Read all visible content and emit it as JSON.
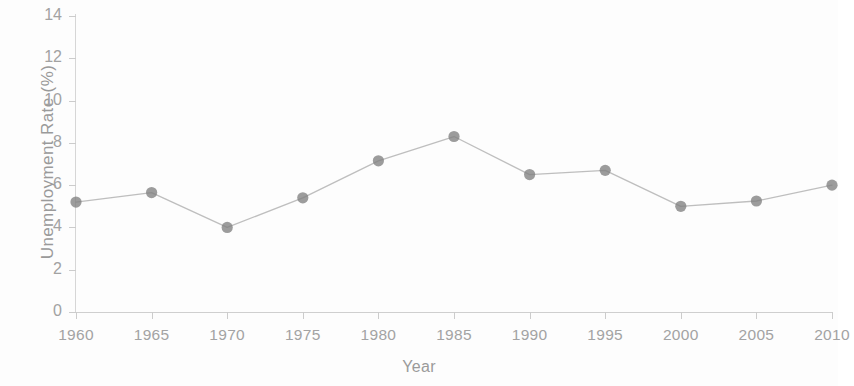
{
  "chart_data": {
    "type": "line",
    "title": "",
    "xlabel": "Year",
    "ylabel": "Unemployment Rate (%)",
    "categories": [
      1960,
      1965,
      1970,
      1975,
      1980,
      1985,
      1990,
      1995,
      2000,
      2005,
      2010
    ],
    "x": [
      1960,
      1965,
      1970,
      1975,
      1980,
      1985,
      1990,
      1995,
      2000,
      2005,
      2010
    ],
    "values": [
      5.2,
      5.65,
      4.0,
      5.4,
      7.15,
      8.3,
      6.5,
      6.7,
      5.0,
      5.25,
      6.0
    ],
    "series": [
      {
        "name": "Unemployment Rate",
        "values": [
          5.2,
          5.65,
          4.0,
          5.4,
          7.15,
          8.3,
          6.5,
          6.7,
          5.0,
          5.25,
          6.0
        ]
      }
    ],
    "xlim": [
      1960,
      2010
    ],
    "ylim": [
      0,
      14
    ],
    "ytick_step": 2,
    "xtick_step": 5,
    "ytick_labels": [
      "0",
      "2",
      "4",
      "6",
      "8",
      "10",
      "12",
      "14"
    ],
    "xtick_labels": [
      "1960",
      "1965",
      "1970",
      "1975",
      "1980",
      "1985",
      "1990",
      "1995",
      "2000",
      "2005",
      "2010"
    ],
    "grid": false,
    "legend": false,
    "legend_position": "none",
    "marker": "circle",
    "line_color": "#b3b3b3",
    "marker_color": "#808080",
    "axis_color": "#cccccc",
    "text_color": "#a0a0a0"
  }
}
